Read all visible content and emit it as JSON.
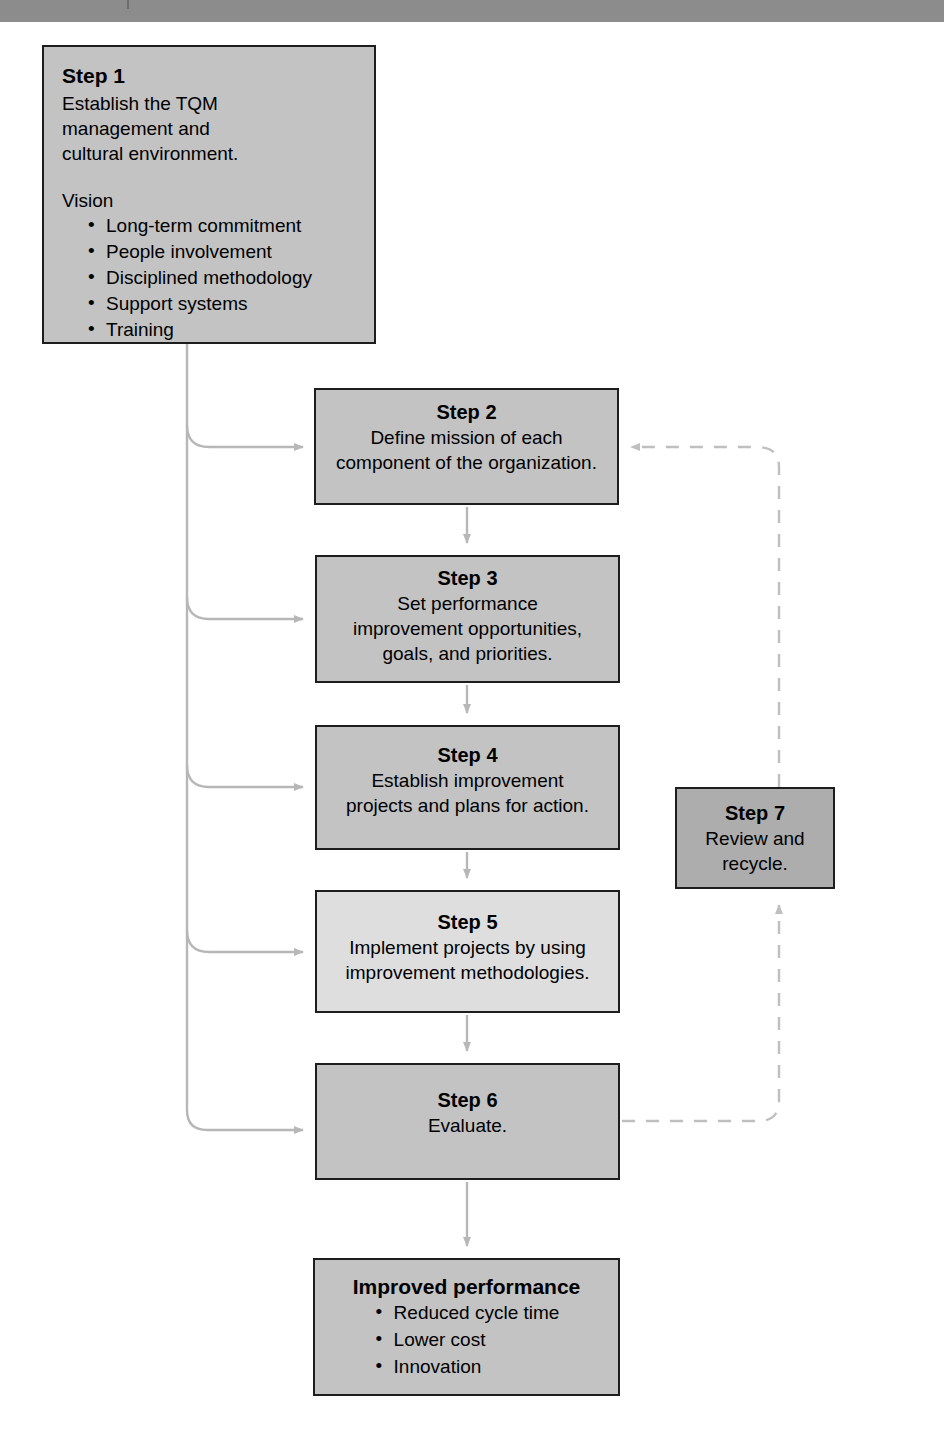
{
  "page": {
    "topbar_color": "#8c8c8c"
  },
  "palette": {
    "box_border": "#1d1d1d",
    "fill_medium": "#c3c3c3",
    "fill_light": "#dedede",
    "fill_dark": "#adadad",
    "connector": "#b7b7b7",
    "shadow": "#d9d9d9"
  },
  "nodes": {
    "step1": {
      "title": "Step 1",
      "body": "Establish the TQM management and cultural environment.",
      "body_lines": [
        "Establish the TQM",
        "management and",
        "cultural environment."
      ],
      "subhead": "Vision",
      "bullets": [
        "Long-term commitment",
        "People involvement",
        "Disciplined methodology",
        "Support systems",
        "Training"
      ]
    },
    "step2": {
      "title": "Step 2",
      "body_lines": [
        "Define mission of each",
        "component of the organization."
      ]
    },
    "step3": {
      "title": "Step 3",
      "body_lines": [
        "Set performance",
        "improvement opportunities,",
        "goals, and priorities."
      ]
    },
    "step4": {
      "title": "Step 4",
      "body_lines": [
        "Establish improvement",
        "projects and plans for action."
      ]
    },
    "step5": {
      "title": "Step 5",
      "body_lines": [
        "Implement projects by using",
        "improvement methodologies."
      ]
    },
    "step6": {
      "title": "Step 6",
      "body_lines": [
        "Evaluate."
      ]
    },
    "step7": {
      "title": "Step 7",
      "body_lines": [
        "Review and",
        "recycle."
      ]
    },
    "outcome": {
      "title": "Improved performance",
      "bullets": [
        "Reduced cycle time",
        "Lower cost",
        "Innovation"
      ]
    }
  },
  "connectors": [
    {
      "name": "step1-to-step2",
      "style": "solid",
      "from": "step1",
      "to": "step2"
    },
    {
      "name": "step1-to-step3",
      "style": "solid",
      "from": "step1",
      "to": "step3"
    },
    {
      "name": "step1-to-step4",
      "style": "solid",
      "from": "step1",
      "to": "step4"
    },
    {
      "name": "step1-to-step5",
      "style": "solid",
      "from": "step1",
      "to": "step5"
    },
    {
      "name": "step1-to-step6",
      "style": "solid",
      "from": "step1",
      "to": "step6"
    },
    {
      "name": "step2-to-step3",
      "style": "solid",
      "from": "step2",
      "to": "step3"
    },
    {
      "name": "step3-to-step4",
      "style": "solid",
      "from": "step3",
      "to": "step4"
    },
    {
      "name": "step4-to-step5",
      "style": "solid",
      "from": "step4",
      "to": "step5"
    },
    {
      "name": "step5-to-step6",
      "style": "solid",
      "from": "step5",
      "to": "step6"
    },
    {
      "name": "step6-to-outcome",
      "style": "solid",
      "from": "step6",
      "to": "outcome"
    },
    {
      "name": "step6-to-step7",
      "style": "dashed",
      "from": "step6",
      "to": "step7"
    },
    {
      "name": "step7-to-step2",
      "style": "dashed",
      "from": "step7",
      "to": "step2"
    }
  ]
}
